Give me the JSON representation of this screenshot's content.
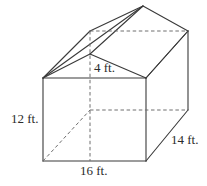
{
  "figure": {
    "type": "geometric-solid",
    "stroke_color": "#3a3a3a",
    "background_color": "#ffffff",
    "labels": {
      "height": "12 ft.",
      "width": "16 ft.",
      "depth": "14 ft.",
      "roof_height": "4 ft."
    },
    "dimensions": [
      {
        "name": "height",
        "value": 12,
        "unit": "ft.",
        "text": "12 ft."
      },
      {
        "name": "width",
        "value": 16,
        "unit": "ft.",
        "text": "16 ft."
      },
      {
        "name": "depth",
        "value": 14,
        "unit": "ft.",
        "text": "14 ft."
      },
      {
        "name": "roof_height",
        "value": 4,
        "unit": "ft.",
        "text": "4 ft."
      }
    ]
  }
}
